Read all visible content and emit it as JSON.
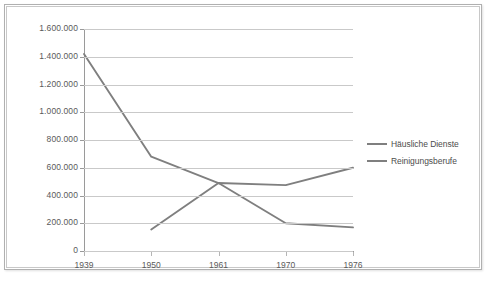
{
  "chart_data": {
    "type": "line",
    "title": "",
    "subtitle": "",
    "xlabel": "",
    "ylabel": "",
    "categories": [
      "1939",
      "1950",
      "1961",
      "1970",
      "1976"
    ],
    "series": [
      {
        "name": "Häusliche Dienste",
        "color": "#7f7f7f",
        "values": [
          1420000,
          680000,
          490000,
          200000,
          170000
        ]
      },
      {
        "name": "Reinigungsberufe",
        "color": "#7f7f7f",
        "values": [
          null,
          155000,
          490000,
          475000,
          600000
        ]
      }
    ],
    "ylim": [
      0,
      1600000
    ],
    "y_ticks": [
      0,
      200000,
      400000,
      600000,
      800000,
      1000000,
      1200000,
      1400000,
      1600000
    ],
    "y_tick_labels": [
      "0",
      "200.000",
      "400.000",
      "600.000",
      "800.000",
      "1.000.000",
      "1.200.000",
      "1.400.000",
      "1.600.000"
    ],
    "grid": true,
    "legend_position": "right",
    "legend_entries": [
      "Häusliche Dienste",
      "Reinigungsberufe"
    ]
  },
  "legend": {
    "items": [
      {
        "label": "Häusliche Dienste"
      },
      {
        "label": "Reinigungsberufe"
      }
    ]
  },
  "colors": {
    "line": "#7f7f7f",
    "grid": "#c9c9c9",
    "axis": "#9a9a9a",
    "text": "#5a5a5a",
    "frame": "#b0b0b0",
    "background": "#ffffff"
  }
}
